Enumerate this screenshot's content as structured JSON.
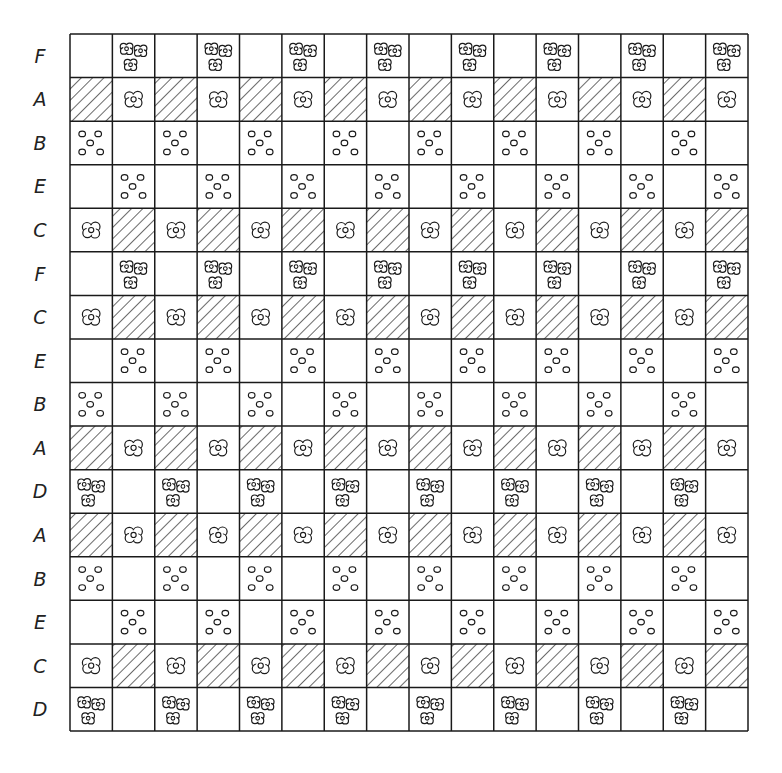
{
  "diagram": {
    "grid": {
      "left": 70,
      "top": 34,
      "right": 748,
      "bottom": 731,
      "columns": 16,
      "rows": 16,
      "line_color": "#1a1a1a",
      "background": "#ffffff"
    },
    "legend_of_cell_types": {
      "empty": "blank square",
      "hatch": "diagonal hatched square",
      "flower": "single flower (four lobes with center)",
      "cluster": "cluster of three flowers",
      "dots": "five small circles"
    },
    "row_patterns": {
      "F": {
        "even": "empty",
        "odd": "cluster"
      },
      "A": {
        "even": "hatch",
        "odd": "flower"
      },
      "B": {
        "even": "dots",
        "odd": "empty"
      },
      "E": {
        "even": "empty",
        "odd": "dots"
      },
      "C": {
        "even": "flower",
        "odd": "hatch"
      },
      "D": {
        "even": "cluster",
        "odd": "empty"
      }
    },
    "rows": [
      {
        "label": "F"
      },
      {
        "label": "A"
      },
      {
        "label": "B"
      },
      {
        "label": "E"
      },
      {
        "label": "C"
      },
      {
        "label": "F"
      },
      {
        "label": "C"
      },
      {
        "label": "E"
      },
      {
        "label": "B"
      },
      {
        "label": "A"
      },
      {
        "label": "D"
      },
      {
        "label": "A"
      },
      {
        "label": "B"
      },
      {
        "label": "E"
      },
      {
        "label": "C"
      },
      {
        "label": "D"
      }
    ]
  }
}
